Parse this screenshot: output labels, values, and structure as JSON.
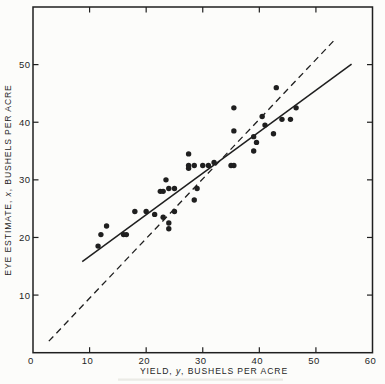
{
  "figure": {
    "paper_color": "#fcfcfa",
    "ink_color": "#1f1f1f"
  },
  "chart_data": {
    "type": "scatter",
    "title": "",
    "xlabel": "YIELD, y, BUSHELS PER ACRE",
    "ylabel": "EYE ESTIMATE, x, BUSHELS PER ACRE",
    "xlabel_parts": {
      "prefix": "YIELD, ",
      "variable": "y",
      "suffix": ", BUSHELS PER ACRE"
    },
    "ylabel_parts": {
      "prefix": "EYE ESTIMATE, ",
      "variable": "x",
      "suffix": ", BUSHELS PER ACRE"
    },
    "xlim": [
      0,
      60
    ],
    "ylim": [
      0,
      60
    ],
    "x_tick_values": [
      10,
      20,
      30,
      40,
      50
    ],
    "y_tick_values": [
      10,
      20,
      30,
      40,
      50
    ],
    "x_tick_labels": [
      {
        "value": 0,
        "label": "0"
      },
      {
        "value": 10,
        "label": "10"
      },
      {
        "value": 20,
        "label": "20"
      },
      {
        "value": 30,
        "label": "30"
      },
      {
        "value": 40,
        "label": "40"
      },
      {
        "value": 50,
        "label": "50"
      },
      {
        "value": 60,
        "label": "60"
      }
    ],
    "y_tick_labels": [
      {
        "value": 10,
        "label": "10"
      },
      {
        "value": 20,
        "label": "20"
      },
      {
        "value": 30,
        "label": "30"
      },
      {
        "value": 40,
        "label": "40"
      },
      {
        "value": 50,
        "label": "50"
      }
    ],
    "grid": false,
    "legend": null,
    "frame": "box-with-inward-ticks-on-all-sides",
    "marker": "filled-circle",
    "series": [
      {
        "name": "eye-estimate-vs-yield-points",
        "points": [
          [
            11.5,
            18.5
          ],
          [
            12,
            20.5
          ],
          [
            13,
            22
          ],
          [
            16,
            20.5
          ],
          [
            16.5,
            20.5
          ],
          [
            18,
            24.5
          ],
          [
            20,
            24.5
          ],
          [
            21.5,
            24
          ],
          [
            23,
            23.5
          ],
          [
            24,
            22.5
          ],
          [
            24,
            21.5
          ],
          [
            25,
            24.5
          ],
          [
            23.5,
            30
          ],
          [
            22.5,
            28
          ],
          [
            23,
            28
          ],
          [
            24,
            28.5
          ],
          [
            25,
            28.5
          ],
          [
            29,
            28.5
          ],
          [
            28.5,
            26.5
          ],
          [
            27.5,
            34.5
          ],
          [
            27.5,
            32.5
          ],
          [
            27.5,
            32
          ],
          [
            28.5,
            32.5
          ],
          [
            30,
            32.5
          ],
          [
            31,
            32.5
          ],
          [
            32,
            33
          ],
          [
            35,
            32.5
          ],
          [
            35.5,
            32.5
          ],
          [
            35.5,
            42.5
          ],
          [
            35.5,
            38.5
          ],
          [
            43,
            46
          ],
          [
            46.5,
            42.5
          ],
          [
            40.5,
            41
          ],
          [
            44,
            40.5
          ],
          [
            45.5,
            40.5
          ],
          [
            41,
            39.5
          ],
          [
            39,
            37.5
          ],
          [
            42.5,
            38
          ],
          [
            39.5,
            36.5
          ],
          [
            39,
            35
          ]
        ]
      }
    ],
    "lines": [
      {
        "name": "fitted-regression-line",
        "style": "solid",
        "points": [
          [
            8.7,
            15.8
          ],
          [
            56.3,
            50.1
          ]
        ]
      },
      {
        "name": "identity-45-degree-line",
        "style": "dashed",
        "points": [
          [
            2.8,
            2.0
          ],
          [
            53.5,
            54.5
          ]
        ]
      }
    ]
  }
}
